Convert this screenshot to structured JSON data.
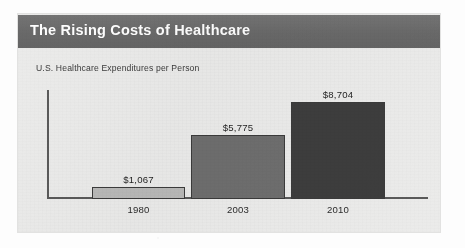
{
  "panel": {
    "title": "The Rising Costs of Healthcare",
    "subtitle": "U.S. Healthcare Expenditures per Person"
  },
  "colors": {
    "header_bar": "#6d6d6d",
    "panel_background": "#ebebea",
    "title_text": "#ffffff",
    "axis": "#5a5a5a",
    "bar_1980": "#b9b9b8",
    "bar_2003": "#6e6e6e",
    "bar_2010": "#3d3d3d"
  },
  "chart_data": {
    "type": "bar",
    "title": "The Rising Costs of Healthcare",
    "subtitle": "U.S. Healthcare Expenditures per Person",
    "xlabel": "",
    "ylabel": "",
    "categories": [
      "1980",
      "2003",
      "2010"
    ],
    "values": [
      1067,
      5775,
      8704
    ],
    "value_labels": [
      "$1,067",
      "$5,775",
      "$8,704"
    ],
    "bar_colors": [
      "#b9b9b8",
      "#6e6e6e",
      "#3d3d3d"
    ],
    "ylim": [
      0,
      8704
    ],
    "grid": false,
    "legend": false,
    "axis_ticks_shown": false,
    "currency": "USD",
    "units": "dollars per person"
  }
}
